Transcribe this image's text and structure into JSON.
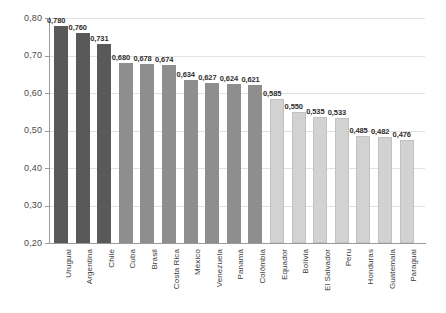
{
  "chart_data": {
    "type": "bar",
    "title": "",
    "subtitle": "",
    "xlabel": "",
    "ylabel": "",
    "ylim": [
      0.2,
      0.8
    ],
    "ytick_labels": [
      "0,80",
      "0,70",
      "0,60",
      "0,50",
      "0,40",
      "0,30",
      "0,20"
    ],
    "ytick_values": [
      0.8,
      0.7,
      0.6,
      0.5,
      0.4,
      0.3,
      0.2
    ],
    "grid": true,
    "legend": "none",
    "decimal_separator": ",",
    "categories": [
      "Uruguai",
      "Argentina",
      "Chile",
      "Cuba",
      "Brasil",
      "Costa Rica",
      "México",
      "Venezuela",
      "Panamá",
      "Colômbia",
      "Equador",
      "Bolívia",
      "El Salvador",
      "Peru",
      "Honduras",
      "Guatemala",
      "Paraguai"
    ],
    "values": [
      0.78,
      0.76,
      0.731,
      0.68,
      0.678,
      0.674,
      0.634,
      0.627,
      0.624,
      0.621,
      0.585,
      0.55,
      0.535,
      0.533,
      0.485,
      0.482,
      0.476
    ],
    "value_labels": [
      "0,780",
      "0,760",
      "0,731",
      "0,680",
      "0,678",
      "0,674",
      "0,634",
      "0,627",
      "0,624",
      "0,621",
      "0,585",
      "0,550",
      "0,535",
      "0,533",
      "0,485",
      "0,482",
      "0,476"
    ],
    "bar_groups": [
      "dark",
      "dark",
      "dark",
      "mid",
      "mid",
      "mid",
      "mid",
      "mid",
      "mid",
      "mid",
      "light",
      "light",
      "light",
      "light",
      "light",
      "light",
      "light"
    ],
    "colors": {
      "dark": "#595959",
      "mid": "#8e8e8e",
      "light": "#d2d2d2",
      "gridline": "#e2e2e2",
      "axis": "#9a9a9a",
      "text": "#3a3a3a",
      "background": "#ffffff"
    }
  }
}
